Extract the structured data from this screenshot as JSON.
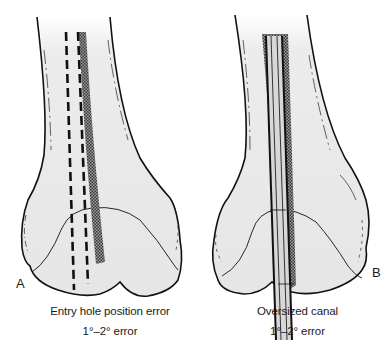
{
  "figure": {
    "panels": [
      {
        "id": "A",
        "label": "A",
        "title": "Entry hole position error",
        "subtitle": "1°–2° error"
      },
      {
        "id": "B",
        "label": "B",
        "title": "Oversized canal",
        "subtitle": "1°–2° error"
      }
    ],
    "colors": {
      "bone_fill": "#ebebeb",
      "outline": "#111111",
      "canal_shading": "#6e6e6e",
      "background": "#ffffff"
    }
  }
}
